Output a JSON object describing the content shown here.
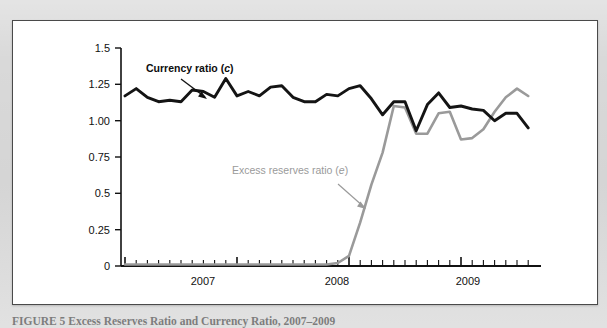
{
  "figure": {
    "caption_label": "FIGURE 5",
    "caption_title": "Excess Reserves Ratio and Currency Ratio, 2007–2009",
    "caption_full": "FIGURE 5   Excess Reserves Ratio and Currency Ratio, 2007–2009",
    "panel_background": "#ffffff",
    "page_background": "#d9d9d9",
    "border_color": "#4a4a4a"
  },
  "chart_data": {
    "type": "line",
    "title": "Excess Reserves Ratio and Currency Ratio, 2007–2009",
    "xlabel": "",
    "ylabel": "",
    "ylim": [
      0,
      1.5
    ],
    "ytick_labels": [
      "0",
      "0.25",
      "0.5",
      "0.75",
      "1.00",
      "1.25",
      "1.5"
    ],
    "ytick_values": [
      0,
      0.25,
      0.5,
      0.75,
      1.0,
      1.25,
      1.5
    ],
    "xtick_labels": [
      "2007",
      "2008",
      "2009"
    ],
    "xtick_values": [
      2007,
      2008,
      2009
    ],
    "grid": false,
    "legend_position": "inline-annotation",
    "x_axis_note": "monthly ticks, late 2006 through late 2009",
    "x": [
      2006.75,
      2006.83,
      2006.92,
      2007.0,
      2007.08,
      2007.17,
      2007.25,
      2007.33,
      2007.42,
      2007.5,
      2007.58,
      2007.67,
      2007.75,
      2007.83,
      2007.92,
      2008.0,
      2008.08,
      2008.17,
      2008.25,
      2008.33,
      2008.42,
      2008.5,
      2008.58,
      2008.67,
      2008.75,
      2008.83,
      2008.92,
      2009.0,
      2009.08,
      2009.17,
      2009.25,
      2009.33,
      2009.42,
      2009.5,
      2009.58,
      2009.67,
      2009.75
    ],
    "series": [
      {
        "name": "Currency ratio (c)",
        "symbol": "c",
        "color": "#141414",
        "label_text": "Currency ratio (c)",
        "values": [
          1.17,
          1.22,
          1.16,
          1.13,
          1.14,
          1.13,
          1.21,
          1.2,
          1.16,
          1.29,
          1.17,
          1.2,
          1.17,
          1.23,
          1.24,
          1.16,
          1.13,
          1.13,
          1.18,
          1.17,
          1.22,
          1.24,
          1.15,
          1.04,
          1.13,
          1.13,
          0.93,
          1.11,
          1.19,
          1.09,
          1.1,
          1.08,
          1.07,
          1.0,
          1.05,
          1.05,
          0.95
        ]
      },
      {
        "name": "Excess reserves ratio (e)",
        "symbol": "e",
        "color": "#9a9a9a",
        "label_text": "Excess reserves ratio (e)",
        "values": [
          0.01,
          0.01,
          0.01,
          0.01,
          0.01,
          0.01,
          0.01,
          0.01,
          0.01,
          0.01,
          0.01,
          0.01,
          0.01,
          0.01,
          0.01,
          0.01,
          0.01,
          0.01,
          0.01,
          0.02,
          0.07,
          0.3,
          0.56,
          0.78,
          1.1,
          1.09,
          0.91,
          0.91,
          1.05,
          1.06,
          0.87,
          0.88,
          0.94,
          1.06,
          1.16,
          1.22,
          1.17
        ]
      }
    ],
    "annotations": [
      {
        "text": "Currency ratio (c)",
        "color": "#0d0d0d",
        "arrow": "down-right"
      },
      {
        "text": "Excess reserves ratio (e)",
        "color": "#9a9a9a",
        "arrow": "down-right"
      }
    ]
  }
}
